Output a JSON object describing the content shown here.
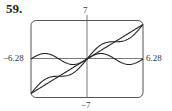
{
  "problem_number": "59.",
  "chart_data": {
    "type": "line",
    "title": "",
    "xlabel": "",
    "ylabel": "",
    "xlim": [
      -6.28,
      6.28
    ],
    "ylim": [
      -7,
      7
    ],
    "grid": false,
    "legend": null,
    "tick_labels": {
      "x_min": "−6.28",
      "x_max": "6.28",
      "y_max": "7",
      "y_min": "−7"
    },
    "series": [
      {
        "name": "y = x",
        "expression": "x",
        "x": [
          -6.28,
          -3.14,
          0,
          3.14,
          6.28
        ],
        "values": [
          -6.28,
          -3.14,
          0,
          3.14,
          6.28
        ]
      },
      {
        "name": "y = sin x",
        "expression": "sin(x)",
        "x": [
          -6.28,
          -4.71,
          -3.14,
          -1.57,
          0,
          1.57,
          3.14,
          4.71,
          6.28
        ],
        "values": [
          0,
          1,
          0,
          -1,
          0,
          1,
          0,
          -1,
          0
        ]
      },
      {
        "name": "y = x + sin x",
        "expression": "x + sin(x)",
        "x": [
          -6.28,
          -4.71,
          -3.14,
          -1.57,
          0,
          1.57,
          3.14,
          4.71,
          6.28
        ],
        "values": [
          -6.28,
          -3.71,
          -3.14,
          -2.57,
          0,
          2.57,
          3.14,
          3.71,
          6.28
        ]
      }
    ]
  }
}
